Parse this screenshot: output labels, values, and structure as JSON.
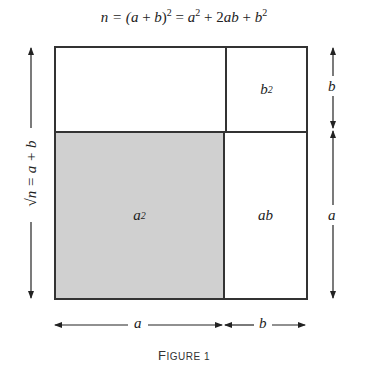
{
  "equation": {
    "lhs": "n = (",
    "a": "a",
    "plus": " + ",
    "b": "b",
    "close": ")",
    "exp": "2",
    "eq": " = ",
    "term1_base": "a",
    "term1_exp": "2",
    "plus2": " + 2",
    "term2": "ab",
    "plus3": " + ",
    "term3_base": "b",
    "term3_exp": "2"
  },
  "cells": {
    "a2": {
      "base": "a",
      "exp": "2",
      "fill": "#d0d0d0"
    },
    "ab": {
      "label": "ab"
    },
    "b2": {
      "base": "b",
      "exp": "2"
    }
  },
  "dimensions": {
    "left": "√n = a + b",
    "right_top": "b",
    "right_bottom": "a",
    "bottom_left": "a",
    "bottom_right": "b"
  },
  "caption": {
    "first": "F",
    "rest": "IGURE 1"
  }
}
